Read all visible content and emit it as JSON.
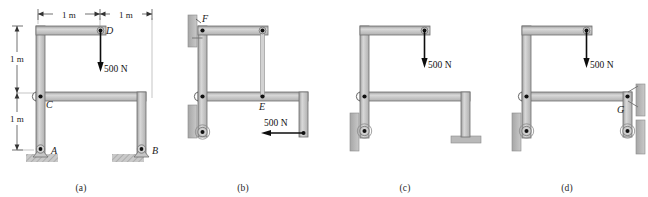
{
  "figure": {
    "type": "engineering-statics-frame-diagram",
    "panel_count": 4,
    "colors": {
      "member_fill": "#bdbdbd",
      "member_light": "#d8d8d8",
      "member_edge": "#7a7a7a",
      "ground_hatch": "#b8b8b8",
      "wall_fill": "#b0b0b0",
      "pin_dot": "#111111",
      "arrow": "#0d0d0d",
      "text": "#1a1a1a",
      "background": "#ffffff"
    }
  },
  "panels": [
    {
      "caption": "(a)",
      "dimensions": [
        {
          "label": "1 m",
          "orientation": "horizontal",
          "position": "top-left"
        },
        {
          "label": "1 m",
          "orientation": "horizontal",
          "position": "top-right"
        },
        {
          "label": "1 m",
          "orientation": "vertical",
          "position": "left-upper"
        },
        {
          "label": "1 m",
          "orientation": "vertical",
          "position": "left-lower"
        }
      ],
      "point_labels": [
        {
          "name": "D",
          "role": "load-application-pin"
        },
        {
          "name": "C",
          "role": "pin-connection"
        },
        {
          "name": "A",
          "role": "pin-support"
        },
        {
          "name": "B",
          "role": "pin-support"
        }
      ],
      "forces": [
        {
          "magnitude": "500 N",
          "direction": "down",
          "at": "D"
        }
      ],
      "supports": [
        {
          "at": "A",
          "type": "pin-on-ground"
        },
        {
          "at": "B",
          "type": "pin-on-ground"
        }
      ]
    },
    {
      "caption": "(b)",
      "dimensions": [],
      "point_labels": [
        {
          "name": "F",
          "role": "pin-connection"
        },
        {
          "name": "E",
          "role": "link-connection"
        }
      ],
      "forces": [
        {
          "magnitude": "500 N",
          "direction": "left",
          "at": "lower-right-end"
        }
      ],
      "supports": [
        {
          "at": "upper-left",
          "type": "pin-on-wall"
        },
        {
          "at": "lower-left",
          "type": "roller-on-wall"
        }
      ]
    },
    {
      "caption": "(c)",
      "dimensions": [],
      "point_labels": [],
      "forces": [
        {
          "magnitude": "500 N",
          "direction": "down",
          "at": "top-right-pin"
        }
      ],
      "supports": [
        {
          "at": "lower-left",
          "type": "roller-on-wall"
        },
        {
          "at": "lower-right",
          "type": "fixed-base"
        }
      ]
    },
    {
      "caption": "(d)",
      "dimensions": [],
      "point_labels": [
        {
          "name": "G",
          "role": "pin-on-wall"
        }
      ],
      "forces": [
        {
          "magnitude": "500 N",
          "direction": "down",
          "at": "top-right-pin"
        }
      ],
      "supports": [
        {
          "at": "G",
          "type": "pin-on-wall"
        },
        {
          "at": "lower-left",
          "type": "roller-on-wall"
        },
        {
          "at": "lower-right",
          "type": "roller-on-wall"
        }
      ]
    }
  ]
}
